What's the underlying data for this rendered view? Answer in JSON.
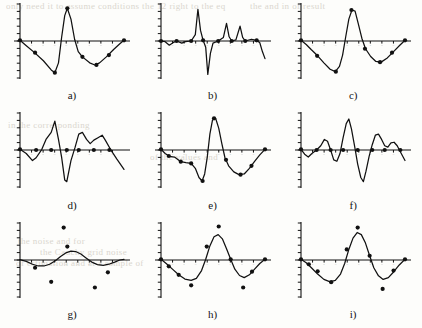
{
  "figure": {
    "type": "multi-panel-plot-grid",
    "rows": 3,
    "columns": 3,
    "panel_count": 9,
    "background_color": "#fdfdfb",
    "ink_color": "#111111",
    "scan_artifact_text_color": "#cfcabf"
  },
  "bleed_through": [
    {
      "text": "only need it to assume conditions the 12 right to the eq",
      "x": 6,
      "y": 1
    },
    {
      "text": "the and in of result",
      "x": 250,
      "y": 1
    },
    {
      "text": "in the corresponding",
      "x": 8,
      "y": 120
    },
    {
      "text": "of the values and",
      "x": 150,
      "y": 152
    },
    {
      "text": "the noise and for",
      "x": 18,
      "y": 236
    },
    {
      "text": "the Cauchy grid noise",
      "x": 40,
      "y": 247
    },
    {
      "text": "of estimation and at a sample of",
      "x": 16,
      "y": 258
    }
  ],
  "panels": [
    {
      "id": "a",
      "label": "a)",
      "description": "Piecewise smooth curve, large negative trough then tall positive spike then second negative trough",
      "axis": {
        "xrange": [
          0,
          1
        ],
        "yrange": [
          -1.05,
          1.05
        ],
        "y_ticks": 11,
        "x_ticks": 9
      },
      "curve": [
        [
          0,
          0.02
        ],
        [
          0.055,
          -0.12
        ],
        [
          0.14,
          -0.33
        ],
        [
          0.225,
          -0.56
        ],
        [
          0.3,
          -0.82
        ],
        [
          0.335,
          -0.9
        ],
        [
          0.37,
          -0.62
        ],
        [
          0.4,
          0.1
        ],
        [
          0.43,
          0.72
        ],
        [
          0.455,
          0.93
        ],
        [
          0.49,
          0.62
        ],
        [
          0.525,
          0.05
        ],
        [
          0.56,
          -0.3
        ],
        [
          0.6,
          -0.45
        ],
        [
          0.67,
          -0.62
        ],
        [
          0.72,
          -0.68
        ],
        [
          0.765,
          -0.62
        ],
        [
          0.83,
          -0.45
        ],
        [
          0.9,
          -0.24
        ],
        [
          0.96,
          -0.08
        ],
        [
          1,
          0.02
        ]
      ],
      "points": [
        [
          0,
          0.02
        ],
        [
          0.145,
          -0.33
        ],
        [
          0.335,
          -0.9
        ],
        [
          0.455,
          0.93
        ],
        [
          0.6,
          -0.45
        ],
        [
          0.735,
          -0.68
        ],
        [
          0.855,
          -0.4
        ],
        [
          1,
          0.02
        ]
      ]
    },
    {
      "id": "b",
      "label": "b)",
      "description": "Spiky oscillatory curve with one tall positive spike, one deep negative spike and two smaller positive spikes",
      "axis": {
        "xrange": [
          0,
          1
        ],
        "yrange": [
          -1.05,
          1.05
        ],
        "y_ticks": 11,
        "x_ticks": 9
      },
      "curve": [
        [
          0,
          0.0
        ],
        [
          0.04,
          -0.02
        ],
        [
          0.08,
          -0.12
        ],
        [
          0.115,
          -0.05
        ],
        [
          0.15,
          0.0
        ],
        [
          0.2,
          -0.06
        ],
        [
          0.235,
          -0.02
        ],
        [
          0.29,
          0.0
        ],
        [
          0.33,
          0.18
        ],
        [
          0.355,
          0.9
        ],
        [
          0.38,
          0.3
        ],
        [
          0.405,
          0.02
        ],
        [
          0.43,
          -0.18
        ],
        [
          0.45,
          -0.95
        ],
        [
          0.475,
          -0.35
        ],
        [
          0.5,
          -0.06
        ],
        [
          0.55,
          0.0
        ],
        [
          0.6,
          0.1
        ],
        [
          0.63,
          0.5
        ],
        [
          0.655,
          0.12
        ],
        [
          0.68,
          0.0
        ],
        [
          0.72,
          0.03
        ],
        [
          0.76,
          0.42
        ],
        [
          0.785,
          0.1
        ],
        [
          0.81,
          0.0
        ],
        [
          0.87,
          0.05
        ],
        [
          0.92,
          0.02
        ],
        [
          0.95,
          -0.05
        ],
        [
          0.975,
          -0.3
        ],
        [
          1,
          -0.5
        ]
      ],
      "points": [
        [
          0,
          0.0
        ],
        [
          0.15,
          0.0
        ],
        [
          0.29,
          0.0
        ],
        [
          0.405,
          0.02
        ],
        [
          0.55,
          0.0
        ],
        [
          0.68,
          0.0
        ],
        [
          0.81,
          0.0
        ],
        [
          0.92,
          0.02
        ]
      ]
    },
    {
      "id": "c",
      "label": "c)",
      "description": "Smooth sinusoidal curve, one full oscillation, negative lobe then positive lobe then negative lobe",
      "axis": {
        "xrange": [
          0,
          1
        ],
        "yrange": [
          -1.05,
          1.05
        ],
        "y_ticks": 11,
        "x_ticks": 9
      },
      "curve": [
        [
          0,
          0.02
        ],
        [
          0.05,
          -0.1
        ],
        [
          0.1,
          -0.25
        ],
        [
          0.16,
          -0.42
        ],
        [
          0.22,
          -0.62
        ],
        [
          0.28,
          -0.8
        ],
        [
          0.33,
          -0.87
        ],
        [
          0.37,
          -0.72
        ],
        [
          0.4,
          -0.4
        ],
        [
          0.43,
          0.12
        ],
        [
          0.46,
          0.62
        ],
        [
          0.49,
          0.88
        ],
        [
          0.52,
          0.85
        ],
        [
          0.55,
          0.5
        ],
        [
          0.585,
          0.08
        ],
        [
          0.62,
          -0.22
        ],
        [
          0.67,
          -0.44
        ],
        [
          0.72,
          -0.58
        ],
        [
          0.77,
          -0.6
        ],
        [
          0.83,
          -0.48
        ],
        [
          0.89,
          -0.3
        ],
        [
          0.95,
          -0.12
        ],
        [
          1,
          0.02
        ]
      ],
      "points": [
        [
          0,
          0.02
        ],
        [
          0.155,
          -0.42
        ],
        [
          0.335,
          -0.87
        ],
        [
          0.485,
          0.88
        ],
        [
          0.615,
          -0.22
        ],
        [
          0.76,
          -0.6
        ],
        [
          0.875,
          -0.33
        ],
        [
          1,
          0.02
        ]
      ]
    },
    {
      "id": "d",
      "label": "d)",
      "description": "Jagged piecewise linear curve with sharp peak and deep trough",
      "axis": {
        "xrange": [
          0,
          1
        ],
        "yrange": [
          -1.05,
          1.05
        ],
        "y_ticks": 11,
        "x_ticks": 9
      },
      "curve": [
        [
          0,
          0.02
        ],
        [
          0.06,
          -0.1
        ],
        [
          0.12,
          -0.3
        ],
        [
          0.155,
          -0.22
        ],
        [
          0.21,
          0.02
        ],
        [
          0.25,
          0.3
        ],
        [
          0.3,
          0.5
        ],
        [
          0.335,
          0.82
        ],
        [
          0.37,
          0.3
        ],
        [
          0.4,
          -0.2
        ],
        [
          0.43,
          -0.85
        ],
        [
          0.45,
          -0.9
        ],
        [
          0.49,
          -0.3
        ],
        [
          0.53,
          0.08
        ],
        [
          0.565,
          0.45
        ],
        [
          0.6,
          0.5
        ],
        [
          0.64,
          0.3
        ],
        [
          0.675,
          0.18
        ],
        [
          0.71,
          0.28
        ],
        [
          0.75,
          0.35
        ],
        [
          0.79,
          0.42
        ],
        [
          0.82,
          0.28
        ],
        [
          0.87,
          0.02
        ],
        [
          0.93,
          -0.25
        ],
        [
          1,
          -0.55
        ]
      ],
      "points": [
        [
          0,
          0.02
        ],
        [
          0.155,
          0.0
        ],
        [
          0.3,
          0.0
        ],
        [
          0.45,
          0.0
        ],
        [
          0.565,
          0.0
        ],
        [
          0.71,
          0.0
        ],
        [
          0.86,
          0.0
        ]
      ]
    },
    {
      "id": "e",
      "label": "e)",
      "description": "Smooth curve with shoulder plateau, deep trough, tall peak and wide trough",
      "axis": {
        "xrange": [
          0,
          1
        ],
        "yrange": [
          -1.05,
          1.05
        ],
        "y_ticks": 11,
        "x_ticks": 9
      },
      "curve": [
        [
          0,
          0.02
        ],
        [
          0.04,
          -0.1
        ],
        [
          0.08,
          -0.18
        ],
        [
          0.13,
          -0.2
        ],
        [
          0.19,
          -0.33
        ],
        [
          0.24,
          -0.36
        ],
        [
          0.29,
          -0.38
        ],
        [
          0.33,
          -0.52
        ],
        [
          0.365,
          -0.78
        ],
        [
          0.395,
          -0.88
        ],
        [
          0.42,
          -0.68
        ],
        [
          0.445,
          -0.2
        ],
        [
          0.47,
          0.45
        ],
        [
          0.495,
          0.85
        ],
        [
          0.525,
          0.9
        ],
        [
          0.555,
          0.62
        ],
        [
          0.585,
          0.18
        ],
        [
          0.615,
          -0.22
        ],
        [
          0.65,
          -0.45
        ],
        [
          0.7,
          -0.62
        ],
        [
          0.75,
          -0.7
        ],
        [
          0.8,
          -0.68
        ],
        [
          0.85,
          -0.52
        ],
        [
          0.9,
          -0.32
        ],
        [
          0.95,
          -0.14
        ],
        [
          1,
          0.02
        ]
      ],
      "points": [
        [
          0,
          0.02
        ],
        [
          0.075,
          -0.17
        ],
        [
          0.19,
          -0.33
        ],
        [
          0.29,
          -0.38
        ],
        [
          0.4,
          -0.88
        ],
        [
          0.51,
          0.9
        ],
        [
          0.625,
          -0.28
        ],
        [
          0.765,
          -0.7
        ],
        [
          0.87,
          -0.45
        ],
        [
          1,
          0.02
        ]
      ]
    },
    {
      "id": "f",
      "label": "f)",
      "description": "Smooth multi-frequency oscillation with tall central peak and deep trough after it",
      "axis": {
        "xrange": [
          0,
          1
        ],
        "yrange": [
          -1.05,
          1.05
        ],
        "y_ticks": 11,
        "x_ticks": 9
      },
      "curve": [
        [
          0,
          0.02
        ],
        [
          0.035,
          -0.12
        ],
        [
          0.07,
          -0.2
        ],
        [
          0.105,
          -0.1
        ],
        [
          0.15,
          0.0
        ],
        [
          0.19,
          0.12
        ],
        [
          0.225,
          0.3
        ],
        [
          0.255,
          0.25
        ],
        [
          0.285,
          0.0
        ],
        [
          0.315,
          -0.28
        ],
        [
          0.345,
          -0.32
        ],
        [
          0.375,
          -0.1
        ],
        [
          0.405,
          0.35
        ],
        [
          0.435,
          0.75
        ],
        [
          0.46,
          0.88
        ],
        [
          0.485,
          0.6
        ],
        [
          0.515,
          0.12
        ],
        [
          0.545,
          -0.4
        ],
        [
          0.575,
          -0.78
        ],
        [
          0.6,
          -0.9
        ],
        [
          0.625,
          -0.6
        ],
        [
          0.655,
          -0.18
        ],
        [
          0.685,
          0.15
        ],
        [
          0.715,
          0.42
        ],
        [
          0.745,
          0.45
        ],
        [
          0.775,
          0.3
        ],
        [
          0.805,
          0.12
        ],
        [
          0.835,
          0.08
        ],
        [
          0.865,
          0.2
        ],
        [
          0.895,
          0.22
        ],
        [
          0.925,
          0.12
        ],
        [
          0.955,
          -0.05
        ],
        [
          1,
          -0.3
        ]
      ],
      "points": [
        [
          0,
          0.02
        ],
        [
          0.15,
          0.0
        ],
        [
          0.285,
          0.0
        ],
        [
          0.405,
          0.0
        ],
        [
          0.545,
          0.0
        ],
        [
          0.685,
          0.0
        ],
        [
          0.805,
          0.0
        ],
        [
          0.955,
          0.0
        ]
      ]
    },
    {
      "id": "g",
      "label": "g)",
      "description": "Low amplitude smooth wiggle near zero with six scattered far outlier points",
      "axis": {
        "xrange": [
          0,
          1
        ],
        "yrange": [
          -1.05,
          1.05
        ],
        "y_ticks": 11,
        "x_ticks": 9
      },
      "curve": [
        [
          0,
          0.01
        ],
        [
          0.06,
          -0.04
        ],
        [
          0.12,
          -0.12
        ],
        [
          0.175,
          -0.17
        ],
        [
          0.23,
          -0.17
        ],
        [
          0.285,
          -0.12
        ],
        [
          0.34,
          -0.02
        ],
        [
          0.39,
          0.1
        ],
        [
          0.44,
          0.2
        ],
        [
          0.49,
          0.25
        ],
        [
          0.535,
          0.24
        ],
        [
          0.585,
          0.17
        ],
        [
          0.635,
          0.06
        ],
        [
          0.69,
          -0.06
        ],
        [
          0.745,
          -0.13
        ],
        [
          0.8,
          -0.15
        ],
        [
          0.855,
          -0.12
        ],
        [
          0.91,
          -0.06
        ],
        [
          0.96,
          0.0
        ],
        [
          1,
          0.02
        ]
      ],
      "points": [
        [
          0.145,
          -0.22
        ],
        [
          0.455,
          0.38
        ],
        [
          0.42,
          0.92
        ],
        [
          0.3,
          -0.62
        ],
        [
          0.72,
          -0.78
        ],
        [
          0.845,
          -0.35
        ]
      ]
    },
    {
      "id": "h",
      "label": "h)",
      "description": "Single smooth sine oscillation with markers on curve and two far outliers",
      "axis": {
        "xrange": [
          0,
          1
        ],
        "yrange": [
          -1.05,
          1.05
        ],
        "y_ticks": 11,
        "x_ticks": 9
      },
      "curve": [
        [
          0,
          0.02
        ],
        [
          0.05,
          -0.1
        ],
        [
          0.11,
          -0.26
        ],
        [
          0.17,
          -0.42
        ],
        [
          0.23,
          -0.54
        ],
        [
          0.29,
          -0.58
        ],
        [
          0.34,
          -0.52
        ],
        [
          0.39,
          -0.3
        ],
        [
          0.43,
          0.02
        ],
        [
          0.47,
          0.4
        ],
        [
          0.51,
          0.66
        ],
        [
          0.55,
          0.72
        ],
        [
          0.59,
          0.6
        ],
        [
          0.63,
          0.32
        ],
        [
          0.67,
          0.02
        ],
        [
          0.71,
          -0.26
        ],
        [
          0.755,
          -0.44
        ],
        [
          0.8,
          -0.5
        ],
        [
          0.85,
          -0.42
        ],
        [
          0.9,
          -0.26
        ],
        [
          0.95,
          -0.1
        ],
        [
          1,
          0.02
        ]
      ],
      "points": [
        [
          0,
          0.02
        ],
        [
          0.075,
          -0.18
        ],
        [
          0.17,
          -0.42
        ],
        [
          0.29,
          -0.72
        ],
        [
          0.44,
          0.38
        ],
        [
          0.555,
          0.95
        ],
        [
          0.67,
          0.02
        ],
        [
          0.79,
          -0.78
        ],
        [
          0.875,
          -0.33
        ],
        [
          1,
          0.02
        ]
      ]
    },
    {
      "id": "i",
      "label": "i)",
      "description": "Single smooth sine oscillation, slightly larger amplitude, markers on curve and two outliers",
      "axis": {
        "xrange": [
          0,
          1
        ],
        "yrange": [
          -1.05,
          1.05
        ],
        "y_ticks": 11,
        "x_ticks": 9
      },
      "curve": [
        [
          0,
          0.02
        ],
        [
          0.05,
          -0.08
        ],
        [
          0.1,
          -0.22
        ],
        [
          0.16,
          -0.4
        ],
        [
          0.22,
          -0.55
        ],
        [
          0.28,
          -0.62
        ],
        [
          0.33,
          -0.58
        ],
        [
          0.38,
          -0.4
        ],
        [
          0.42,
          -0.1
        ],
        [
          0.46,
          0.3
        ],
        [
          0.5,
          0.62
        ],
        [
          0.54,
          0.78
        ],
        [
          0.58,
          0.72
        ],
        [
          0.62,
          0.48
        ],
        [
          0.66,
          0.12
        ],
        [
          0.7,
          -0.22
        ],
        [
          0.745,
          -0.45
        ],
        [
          0.79,
          -0.55
        ],
        [
          0.84,
          -0.5
        ],
        [
          0.89,
          -0.34
        ],
        [
          0.945,
          -0.14
        ],
        [
          1,
          0.02
        ]
      ],
      "points": [
        [
          0,
          0.02
        ],
        [
          0.075,
          -0.12
        ],
        [
          0.16,
          -0.32
        ],
        [
          0.29,
          -0.63
        ],
        [
          0.44,
          0.3
        ],
        [
          0.545,
          0.92
        ],
        [
          0.66,
          0.12
        ],
        [
          0.785,
          -0.82
        ],
        [
          0.89,
          -0.3
        ],
        [
          1,
          0.02
        ]
      ]
    }
  ]
}
